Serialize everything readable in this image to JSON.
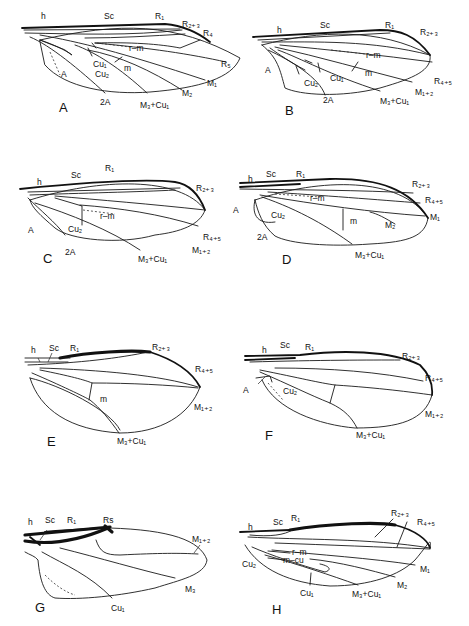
{
  "figure": {
    "panels": [
      {
        "id": "A",
        "labels": {
          "h": "h",
          "sc": "Sc",
          "r1": "R₁",
          "r23": "R₂₊₃",
          "r4": "R₄",
          "r5": "R₅",
          "rm": "r–m",
          "m": "m",
          "cu1": "Cu₁",
          "cu2": "Cu₂",
          "a": "A",
          "a2": "2A",
          "m3cu1": "M₃+Cu₁",
          "m2": "M₂",
          "m1": "M₁"
        }
      },
      {
        "id": "B",
        "labels": {
          "h": "h",
          "sc": "Sc",
          "r1": "R₁",
          "r23": "R₂₊₃",
          "rm": "r–m",
          "m": "m",
          "a": "A",
          "cu2": "Cu₂",
          "cu1": "Cu₁",
          "a2": "2A",
          "m3cu1": "M₃+Cu₁",
          "m12": "M₁₊₂",
          "r45": "R₄₊₅"
        }
      },
      {
        "id": "C",
        "labels": {
          "h": "h",
          "sc": "Sc",
          "r1": "R₁",
          "r23": "R₂₊₃",
          "rm": "r–m",
          "a": "A",
          "cu2": "Cu₂",
          "a2": "2A",
          "m3cu1": "M₃+Cu₁",
          "r45": "R₄₊₅",
          "m12": "M₁₊₂"
        }
      },
      {
        "id": "D",
        "labels": {
          "h": "h",
          "sc": "Sc",
          "r1": "R₁",
          "r23": "R₂₊₃",
          "r45": "R₄₊₅",
          "rm": "r–m",
          "a": "A",
          "cu2": "Cu₂",
          "a2": "2A",
          "m": "m",
          "m2": "M₂",
          "m1": "M₁",
          "m3cu1": "M₃+Cu₁"
        }
      },
      {
        "id": "E",
        "labels": {
          "h": "h",
          "sc": "Sc",
          "r1": "R₁",
          "r23": "R₂₊₃",
          "r45": "R₄₊₅",
          "m": "m",
          "m12": "M₁₊₂",
          "m3cu1": "M₃+Cu₁"
        }
      },
      {
        "id": "F",
        "labels": {
          "h": "h",
          "sc": "Sc",
          "r1": "R₁",
          "r23": "R₂₊₃",
          "r45": "R₄₊₅",
          "a": "A",
          "cu2": "Cu₂",
          "m12": "M₁₊₂",
          "m3cu1": "M₃+Cu₁"
        }
      },
      {
        "id": "G",
        "labels": {
          "h": "h",
          "sc": "Sc",
          "r1": "R₁",
          "rs": "Rs",
          "m12": "M₁₊₂",
          "m3": "M₃",
          "cu1": "Cu₁"
        }
      },
      {
        "id": "H",
        "labels": {
          "h": "h",
          "sc": "Sc",
          "r1": "R₁",
          "r23": "R₂₊₃",
          "r45": "R₄₊₅",
          "rm": "r–m",
          "mcu": "m–cu",
          "cu2": "Cu₂",
          "cu1": "Cu₁",
          "m1": "M₁",
          "m2": "M₂",
          "m3cu1": "M₃+Cu₁"
        }
      }
    ]
  }
}
